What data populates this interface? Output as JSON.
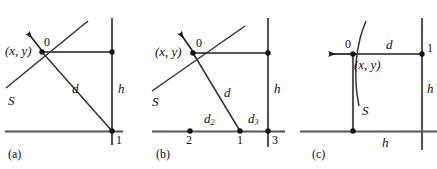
{
  "figure": {
    "width": 437,
    "height": 169,
    "background": "#ffffff",
    "line_color": "#4d4d4d",
    "ray_color": "#333333",
    "text_color": "#111111",
    "panels": [
      {
        "caption": "(a)",
        "labels": {
          "origin": "0",
          "point_xy": "(x, y)",
          "surface": "S",
          "distance": "d",
          "height": "h",
          "node_1": "1"
        }
      },
      {
        "caption": "(b)",
        "labels": {
          "origin": "0",
          "point_xy": "(x, y)",
          "surface": "S",
          "distance": "d",
          "height": "h",
          "node_1": "1",
          "node_2": "2",
          "node_3": "3",
          "distance_2": "d",
          "distance_2_sub": "2",
          "distance_3": "d",
          "distance_3_sub": "3"
        }
      },
      {
        "caption": "(c)",
        "labels": {
          "origin": "0",
          "point_xy": "(x, y)",
          "surface": "S",
          "distance": "d",
          "height_right": "h",
          "height_bottom": "h",
          "node_1": "1"
        }
      }
    ]
  }
}
